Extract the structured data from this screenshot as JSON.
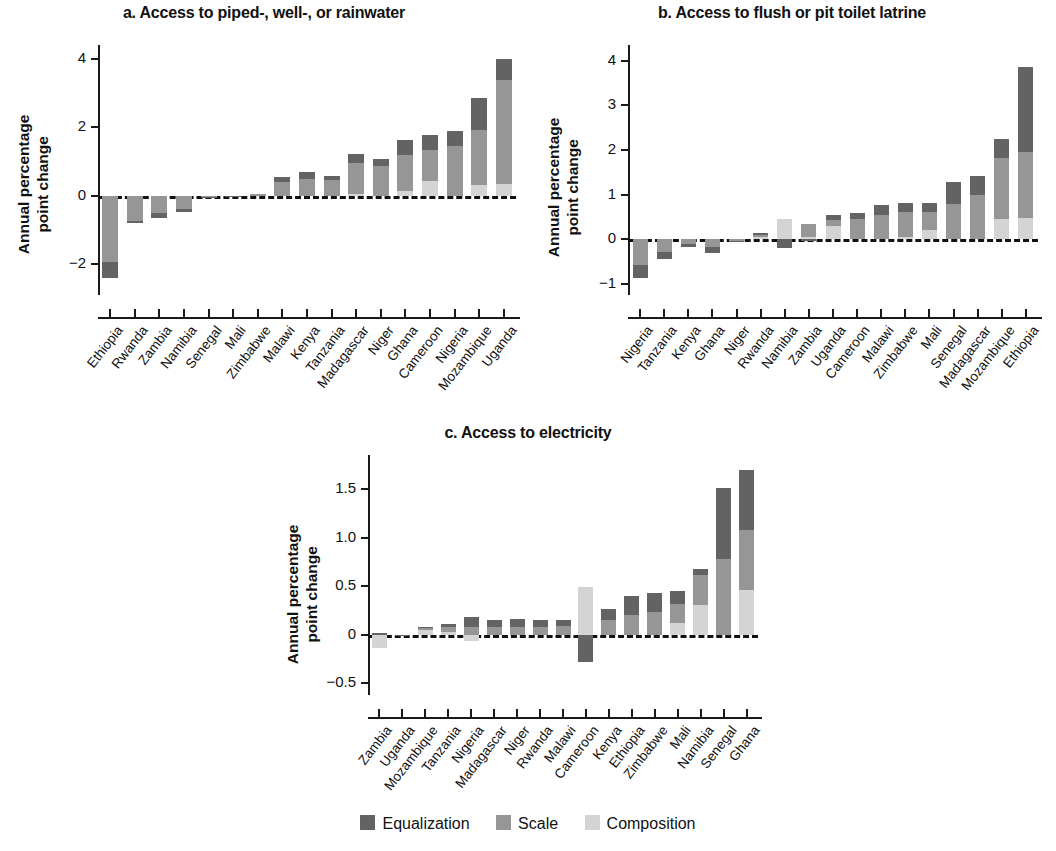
{
  "figure": {
    "ylabel": "Annual percentage point change",
    "ylabel_line1": "Annual percentage",
    "ylabel_line2": "point change"
  },
  "legend": {
    "items": [
      {
        "label": "Equalization",
        "color": "#636363"
      },
      {
        "label": "Scale",
        "color": "#969696"
      },
      {
        "label": "Composition",
        "color": "#d4d4d4"
      }
    ]
  },
  "chart_data": [
    {
      "type": "bar",
      "id": "panel-a",
      "title": "a. Access to piped-, well-, or rainwater",
      "xlabel": "",
      "ylabel": "Annual percentage point change",
      "ylim": [
        -2.9,
        4.4
      ],
      "yticks": [
        -2,
        0,
        2,
        4
      ],
      "ytick_labels": [
        "−2",
        "0",
        "2",
        "4"
      ],
      "grid": false,
      "stacked": true,
      "legend_position": "bottom",
      "categories": [
        "Ethiopia",
        "Rwanda",
        "Zambia",
        "Namibia",
        "Senegal",
        "Mali",
        "Zimbabwe",
        "Malawi",
        "Kenya",
        "Tanzania",
        "Madagascar",
        "Niger",
        "Ghana",
        "Cameroon",
        "Nigeria",
        "Mozambique",
        "Uganda"
      ],
      "series": [
        {
          "name": "Equalization",
          "color": "#636363",
          "values": [
            -0.45,
            -0.05,
            -0.15,
            -0.1,
            -0.02,
            -0.01,
            0.0,
            0.16,
            0.2,
            0.12,
            0.28,
            0.2,
            0.42,
            0.45,
            0.45,
            0.92,
            0.62
          ]
        },
        {
          "name": "Scale",
          "color": "#969696",
          "values": [
            -1.95,
            -0.75,
            -0.5,
            -0.38,
            -0.03,
            -0.01,
            0.06,
            0.4,
            0.48,
            0.46,
            0.88,
            0.88,
            1.05,
            0.9,
            1.45,
            1.6,
            3.05
          ]
        },
        {
          "name": "Composition",
          "color": "#d4d4d4",
          "values": [
            0.0,
            0.0,
            0.0,
            0.0,
            0.0,
            0.0,
            0.0,
            0.0,
            0.0,
            0.0,
            0.06,
            0.0,
            0.15,
            0.42,
            0.0,
            0.32,
            0.33
          ]
        }
      ],
      "totals": [
        -2.4,
        -0.8,
        -0.65,
        -0.48,
        -0.05,
        -0.02,
        0.06,
        0.56,
        0.68,
        0.58,
        1.22,
        1.08,
        1.62,
        1.77,
        1.9,
        2.84,
        4.0
      ]
    },
    {
      "type": "bar",
      "id": "panel-b",
      "title": "b. Access to flush or pit toilet latrine",
      "xlabel": "",
      "ylabel": "Annual percentage point change",
      "ylim": [
        -1.25,
        4.35
      ],
      "yticks": [
        -1,
        0,
        1,
        2,
        3,
        4
      ],
      "ytick_labels": [
        "−1",
        "0",
        "1",
        "2",
        "3",
        "4"
      ],
      "grid": false,
      "stacked": true,
      "legend_position": "bottom",
      "categories": [
        "Nigeria",
        "Tanzania",
        "Kenya",
        "Ghana",
        "Niger",
        "Rwanda",
        "Namibia",
        "Zambia",
        "Uganda",
        "Cameroon",
        "Malawi",
        "Zimbabwe",
        "Mali",
        "Senegal",
        "Madagascar",
        "Mozambique",
        "Ethiopia"
      ],
      "series": [
        {
          "name": "Equalization",
          "color": "#636363",
          "values": [
            -0.28,
            -0.17,
            -0.08,
            -0.12,
            -0.02,
            0.05,
            -0.2,
            -0.04,
            0.12,
            0.14,
            0.22,
            0.22,
            0.2,
            0.5,
            0.42,
            0.42,
            1.9
          ]
        },
        {
          "name": "Scale",
          "color": "#969696",
          "values": [
            -0.58,
            -0.28,
            -0.1,
            -0.18,
            -0.03,
            0.04,
            0.0,
            0.27,
            0.13,
            0.45,
            0.55,
            0.55,
            0.42,
            0.78,
            1.0,
            1.38,
            1.47
          ]
        },
        {
          "name": "Composition",
          "color": "#d4d4d4",
          "values": [
            0.0,
            0.0,
            0.0,
            0.0,
            0.0,
            0.06,
            0.45,
            0.06,
            0.3,
            0.0,
            0.0,
            0.05,
            0.2,
            0.0,
            0.0,
            0.45,
            0.48
          ]
        }
      ],
      "totals": [
        -0.86,
        -0.45,
        -0.18,
        -0.3,
        -0.05,
        0.15,
        0.25,
        0.29,
        0.55,
        0.59,
        0.77,
        0.82,
        0.82,
        1.28,
        1.42,
        2.25,
        3.85
      ]
    },
    {
      "type": "bar",
      "id": "panel-c",
      "title": "c. Access to electricity",
      "xlabel": "",
      "ylabel": "Annual percentage point change",
      "ylim": [
        -0.62,
        1.85
      ],
      "yticks": [
        -0.5,
        0,
        0.5,
        1.0,
        1.5
      ],
      "ytick_labels": [
        "−0.5",
        "0",
        "0.5",
        "1.0",
        "1.5"
      ],
      "grid": false,
      "stacked": true,
      "legend_position": "bottom",
      "categories": [
        "Zambia",
        "Uganda",
        "Mozambique",
        "Tanzania",
        "Nigeria",
        "Madagascar",
        "Niger",
        "Rwanda",
        "Malawi",
        "Cameroon",
        "Kenya",
        "Ethiopia",
        "Zimbabwe",
        "Mali",
        "Namibia",
        "Senegal",
        "Ghana"
      ],
      "series": [
        {
          "name": "Equalization",
          "color": "#636363",
          "values": [
            0.02,
            -0.01,
            0.01,
            0.03,
            0.1,
            0.07,
            0.08,
            0.07,
            0.06,
            -0.28,
            0.12,
            0.2,
            0.2,
            0.13,
            0.07,
            0.73,
            0.62
          ]
        },
        {
          "name": "Scale",
          "color": "#969696",
          "values": [
            0.0,
            0.0,
            0.02,
            0.05,
            0.08,
            0.08,
            0.08,
            0.08,
            0.09,
            0.0,
            0.15,
            0.2,
            0.23,
            0.2,
            0.3,
            0.78,
            0.62
          ]
        },
        {
          "name": "Composition",
          "color": "#d4d4d4",
          "values": [
            -0.14,
            0.0,
            0.05,
            0.03,
            -0.06,
            0.0,
            0.0,
            0.0,
            0.0,
            0.49,
            0.0,
            0.0,
            0.0,
            0.12,
            0.31,
            0.0,
            0.46
          ]
        }
      ],
      "totals": [
        0.04,
        -0.01,
        0.08,
        0.11,
        0.18,
        0.15,
        0.16,
        0.15,
        0.15,
        0.21,
        0.27,
        0.4,
        0.43,
        0.45,
        0.68,
        1.51,
        1.7
      ]
    }
  ]
}
